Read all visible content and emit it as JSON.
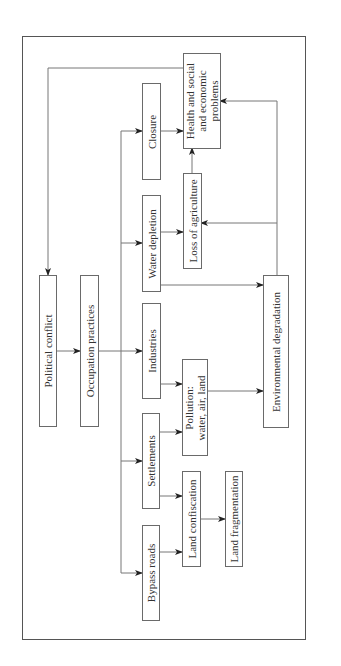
{
  "figure": {
    "orientation": "rotated-90-ccw",
    "nodes": {
      "political_conflict": "Political conflict",
      "occupation_practices": "Occupation practices",
      "bypass_roads": "Bypass roads",
      "settlements": "Settlements",
      "industries": "Industries",
      "water_depletion": "Water depletion",
      "closure": "Closure",
      "land_confiscation": "Land confiscation",
      "land_fragmentation": "Land fragmentation",
      "pollution_line1": "Pollution:",
      "pollution_line2": "water, air, land",
      "loss_of_agriculture": "Loss of agriculture",
      "health_line1": "Health and social",
      "health_line2": "and economic",
      "health_line3": "problems",
      "environmental_degradation": "Environmental degradation"
    },
    "edges": [
      [
        "Political conflict",
        "Occupation practices"
      ],
      [
        "Occupation practices",
        "Bypass roads"
      ],
      [
        "Occupation practices",
        "Settlements"
      ],
      [
        "Occupation practices",
        "Industries"
      ],
      [
        "Occupation practices",
        "Water depletion"
      ],
      [
        "Occupation practices",
        "Closure"
      ],
      [
        "Bypass roads",
        "Land confiscation"
      ],
      [
        "Settlements",
        "Land confiscation"
      ],
      [
        "Land confiscation",
        "Land fragmentation"
      ],
      [
        "Settlements",
        "Pollution: water, air, land"
      ],
      [
        "Industries",
        "Pollution: water, air, land"
      ],
      [
        "Pollution: water, air, land",
        "Environmental degradation"
      ],
      [
        "Water depletion",
        "Loss of agriculture"
      ],
      [
        "Water depletion",
        "Environmental degradation"
      ],
      [
        "Environmental degradation",
        "Loss of agriculture"
      ],
      [
        "Environmental degradation",
        "Health and social and economic problems"
      ],
      [
        "Loss of agriculture",
        "Health and social and economic problems"
      ],
      [
        "Closure",
        "Health and social and economic problems"
      ],
      [
        "Health and social and economic problems",
        "Political conflict"
      ]
    ],
    "colors": {
      "line": "#6a6a6a",
      "frame": "#555555",
      "text": "#333333"
    }
  }
}
